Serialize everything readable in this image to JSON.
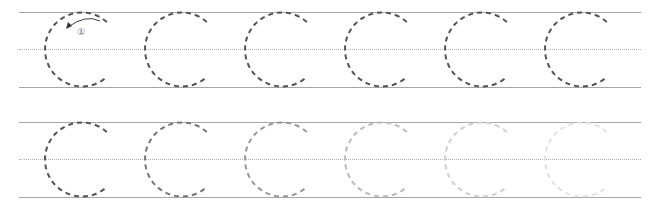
{
  "worksheet": {
    "letter": "C",
    "guide_color": "#a6a6a6",
    "rows": [
      {
        "name": "row-1",
        "top": 12,
        "mid": 49,
        "bottom": 87,
        "letters": [
          {
            "cx": 82,
            "color": "#555555",
            "opacity": 1.0,
            "stroke_hint": true
          },
          {
            "cx": 182,
            "color": "#555555",
            "opacity": 1.0
          },
          {
            "cx": 282,
            "color": "#555555",
            "opacity": 1.0
          },
          {
            "cx": 382,
            "color": "#555555",
            "opacity": 1.0
          },
          {
            "cx": 482,
            "color": "#555555",
            "opacity": 1.0
          },
          {
            "cx": 582,
            "color": "#555555",
            "opacity": 1.0
          }
        ]
      },
      {
        "name": "row-2",
        "top": 122,
        "mid": 159,
        "bottom": 197,
        "letters": [
          {
            "cx": 82,
            "color": "#555555",
            "opacity": 1.0
          },
          {
            "cx": 182,
            "color": "#777777",
            "opacity": 1.0
          },
          {
            "cx": 282,
            "color": "#999999",
            "opacity": 1.0
          },
          {
            "cx": 382,
            "color": "#bbbbbb",
            "opacity": 1.0
          },
          {
            "cx": 482,
            "color": "#d0d0d0",
            "opacity": 1.0
          },
          {
            "cx": 582,
            "color": "#e2e2e2",
            "opacity": 1.0
          }
        ]
      }
    ],
    "stroke_hint": {
      "number": "①",
      "direction": "counterclockwise"
    }
  }
}
